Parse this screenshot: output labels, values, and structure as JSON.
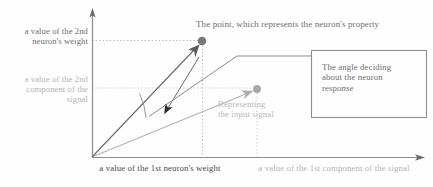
{
  "figure": {
    "kind": "vector-space-diagram",
    "background": "#fefefe"
  },
  "axes": {
    "origin": {
      "x": 92,
      "y": 157
    },
    "y_axis": {
      "x": 92,
      "top": 10,
      "bottom": 157,
      "color": "#8e8c90"
    },
    "x_axis": {
      "y": 157,
      "left": 92,
      "right": 424,
      "color": "#8e8c90"
    },
    "labels": {
      "y_weight": "a value of the 2nd\nneuron's weight",
      "y_signal": "a value of the 2nd\ncomponent of the\nsignal",
      "x_weight": "a value of the 1st neuron's weight",
      "x_signal": "a value of the 1st component of the signal"
    }
  },
  "annotations": {
    "point_caption": "The point, which represents the neuron's property",
    "signal_caption": "Representing\nthe input signal",
    "angle_box_caption": "The angle deciding\nabout the neuron\nresponse"
  },
  "vectors": [
    {
      "name": "weight-vector",
      "from": {
        "x": 92,
        "y": 157
      },
      "to": {
        "x": 202,
        "y": 41
      },
      "color": "#6b696e",
      "tip_x_label": "a value of the 1st neuron's weight",
      "tip_y_label": "a value of the 2nd neuron's weight"
    },
    {
      "name": "signal-vector",
      "from": {
        "x": 92,
        "y": 157
      },
      "to": {
        "x": 257,
        "y": 89
      },
      "color": "#b4b2b6",
      "tip_x_label": "a value of the 1st component of the signal",
      "tip_y_label": "a value of the 2nd component of the signal"
    }
  ],
  "points": [
    {
      "name": "weight-point",
      "x": 202,
      "y": 41,
      "r": 4.3,
      "color": "#7a777d"
    },
    {
      "name": "signal-point",
      "x": 257,
      "y": 89,
      "r": 4.0,
      "color": "#a9a7ac"
    }
  ],
  "guides": [
    {
      "name": "weight-h-guide",
      "x1": 92,
      "y1": 41,
      "x2": 200,
      "y2": 41,
      "color": "#bcbabe"
    },
    {
      "name": "weight-v-guide",
      "x1": 202,
      "y1": 44,
      "x2": 202,
      "y2": 157,
      "color": "#bcbabe"
    },
    {
      "name": "signal-h-guide",
      "x1": 92,
      "y1": 88,
      "x2": 254,
      "y2": 88,
      "color": "#cfcdd1"
    },
    {
      "name": "signal-v-guide",
      "x1": 257,
      "y1": 92,
      "x2": 257,
      "y2": 157,
      "color": "#cfcdd1"
    }
  ],
  "angle_marker": {
    "name": "angle-arc",
    "vertex": {
      "x": 92,
      "y": 157
    },
    "arrow_tip": {
      "x": 165,
      "y": 112
    },
    "color": "#6b696e"
  },
  "callout_box": {
    "name": "angle-callout-box",
    "x": 311,
    "y": 50,
    "width": 116,
    "height": 68,
    "border": "#8e8c90",
    "leader": [
      {
        "x": 150,
        "y": 115
      },
      {
        "x": 237,
        "y": 56
      },
      {
        "x": 311,
        "y": 56
      }
    ]
  },
  "colors": {
    "ink_dark": "#4c4a4e",
    "ink_mid": "#6f6d72",
    "ink_light": "#b4b2b6",
    "axis": "#8e8c90"
  }
}
